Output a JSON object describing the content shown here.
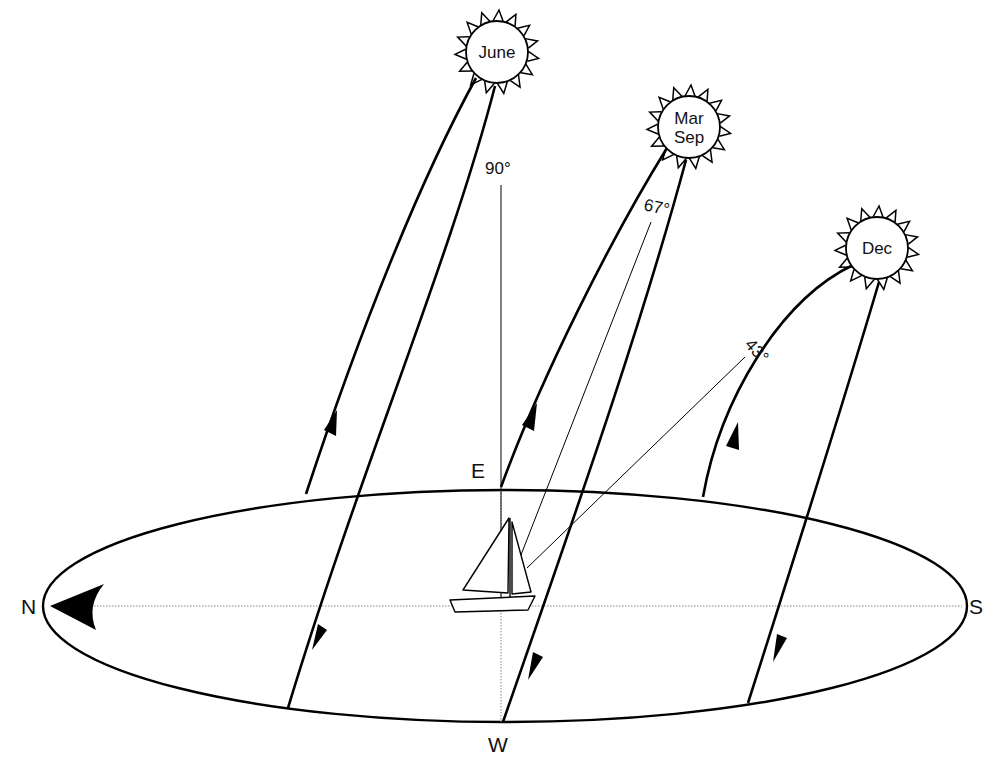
{
  "diagram": {
    "compass": {
      "north": "N",
      "south": "S",
      "east": "E",
      "west": "W"
    },
    "suns": [
      {
        "id": "june",
        "label_lines": [
          "June"
        ],
        "cx": 497,
        "cy": 52
      },
      {
        "id": "mar-sep",
        "label_lines": [
          "Mar",
          "Sep"
        ],
        "cx": 689,
        "cy": 127
      },
      {
        "id": "dec",
        "label_lines": [
          "Dec"
        ],
        "cx": 877,
        "cy": 248
      }
    ],
    "angles": [
      {
        "id": "june-altitude",
        "label": "90°"
      },
      {
        "id": "equinox-altitude",
        "label": "67°"
      },
      {
        "id": "dec-altitude",
        "label": "43°"
      }
    ],
    "colors": {
      "stroke": "#000000",
      "background": "#ffffff",
      "axis": "#888888"
    }
  }
}
